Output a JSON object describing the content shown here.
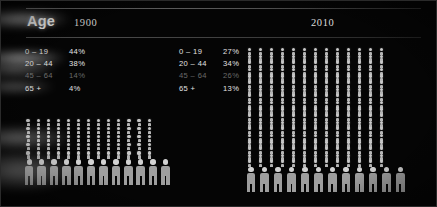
{
  "header": {
    "title": "Age",
    "year_left": "1900",
    "year_right": "2010"
  },
  "chart_data": {
    "type": "pictogram",
    "title": "Age",
    "xlabel": "",
    "ylabel": "",
    "categories": [
      "0 – 19",
      "20 – 44",
      "45 – 64",
      "65 +"
    ],
    "series": [
      {
        "name": "1900",
        "values": [
          44,
          38,
          14,
          4
        ],
        "unit": "%"
      },
      {
        "name": "2010",
        "values": [
          27,
          34,
          26,
          13
        ],
        "unit": "%"
      }
    ],
    "legend_position": "top-left",
    "grid": false
  },
  "panels": [
    {
      "id": "panel-1900",
      "year": "1900",
      "rows": [
        {
          "band": "0 – 19",
          "pct": "44%",
          "dim": false
        },
        {
          "band": "20 – 44",
          "pct": "38%",
          "dim": false
        },
        {
          "band": "45 – 64",
          "pct": "14%",
          "dim": true
        },
        {
          "band": "65 +",
          "pct": "4%",
          "dim": false
        }
      ],
      "pictogram": {
        "columns": 13,
        "micro_rows": 5,
        "large_figures": 12
      }
    },
    {
      "id": "panel-2010",
      "year": "2010",
      "rows": [
        {
          "band": "0 – 19",
          "pct": "27%",
          "dim": false
        },
        {
          "band": "20 – 44",
          "pct": "34%",
          "dim": false
        },
        {
          "band": "45 – 64",
          "pct": "26%",
          "dim": true
        },
        {
          "band": "65 +",
          "pct": "13%",
          "dim": false
        }
      ],
      "pictogram": {
        "columns": 13,
        "micro_rows": 18,
        "large_figures": 12
      }
    }
  ],
  "colors": {
    "background": "#050505",
    "text": "#e2e2e2",
    "text_bright": "#ffffff",
    "text_dim": "#6a6a6a",
    "figure_head": "#c9c9c9",
    "figure_body": "#9e9e9e",
    "rule": "#8d8d8d"
  }
}
